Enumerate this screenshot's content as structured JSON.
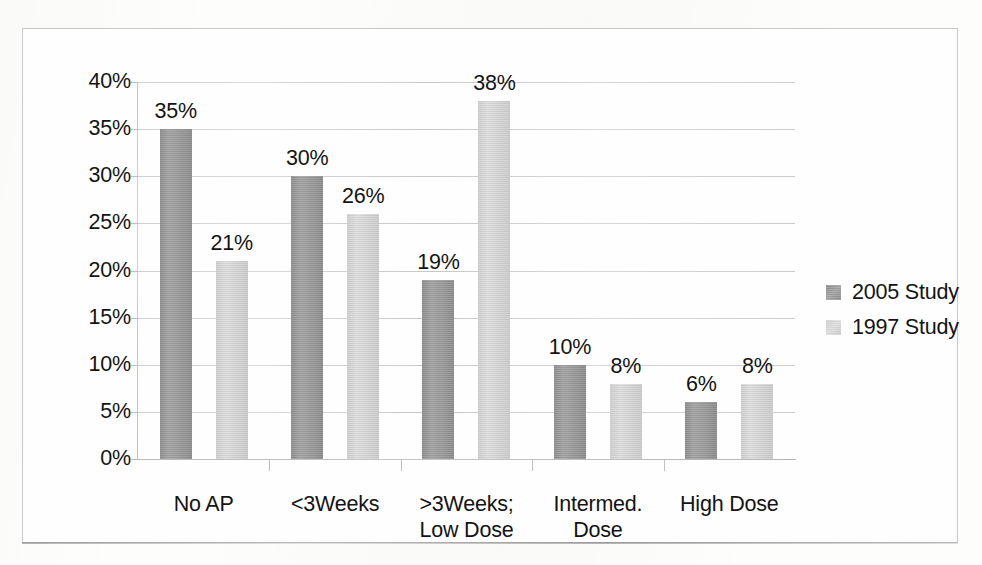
{
  "chart_data": {
    "type": "bar",
    "title": "",
    "subtitle": "",
    "xlabel": "",
    "ylabel": "",
    "grid": true,
    "legend_position": "right",
    "ylim": [
      0,
      40
    ],
    "ytick_step": 5,
    "ytick_labels": [
      "40%",
      "35%",
      "30%",
      "25%",
      "20%",
      "15%",
      "10%",
      "5%",
      "0%"
    ],
    "ytick_values": [
      40,
      35,
      30,
      25,
      20,
      15,
      10,
      5,
      0
    ],
    "categories": [
      "No AP",
      "<3Weeks",
      ">3Weeks; Low Dose",
      "Intermed. Dose",
      "High Dose"
    ],
    "category_label_lines": [
      [
        "No AP"
      ],
      [
        "<3Weeks"
      ],
      [
        ">3Weeks;",
        "Low Dose"
      ],
      [
        "Intermed.",
        "Dose"
      ],
      [
        "High Dose"
      ]
    ],
    "series": [
      {
        "name": "2005 Study",
        "color": "#999999",
        "values": [
          35,
          30,
          19,
          10,
          6
        ],
        "data_labels": [
          "35%",
          "30%",
          "19%",
          "10%",
          "6%"
        ]
      },
      {
        "name": "1997 Study",
        "color": "#d4d4d4",
        "values": [
          21,
          26,
          38,
          8,
          8
        ],
        "data_labels": [
          "21%",
          "26%",
          "38%",
          "8%",
          "8%"
        ]
      }
    ],
    "annotations": []
  },
  "legend": {
    "entries": [
      {
        "label": "2005 Study",
        "swatch": "legend-swatch-dark"
      },
      {
        "label": "1997 Study",
        "swatch": "legend-swatch-light"
      }
    ]
  },
  "colors": {
    "series_2005": "#999999",
    "series_1997": "#d4d4d4",
    "gridline": "#cfcfcf",
    "axis": "#bdbdbd",
    "text": "#141414",
    "frame": "#c9c9c9",
    "background": "#fefefe"
  }
}
